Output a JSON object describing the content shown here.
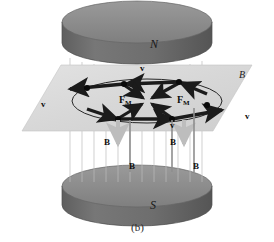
{
  "figure": {
    "caption": "(b)",
    "background_color": "#ffffff"
  },
  "poles": {
    "north": {
      "label": "N",
      "name": "north-pole-cylinder"
    },
    "south": {
      "label": "S",
      "name": "south-pole-cylinder"
    }
  },
  "plane": {
    "field_label": "B",
    "color": "#d9d9d9"
  },
  "velocity_labels": [
    {
      "text": "v",
      "x": 140,
      "y": 64
    },
    {
      "text": "v",
      "x": 41,
      "y": 100
    },
    {
      "text": "v",
      "x": 245,
      "y": 112
    },
    {
      "text": "v",
      "x": 170,
      "y": 121
    }
  ],
  "force_labels": [
    {
      "text": "F",
      "sub": "M",
      "x": 119,
      "y": 95
    },
    {
      "text": "F",
      "sub": "M",
      "x": 177,
      "y": 95
    }
  ],
  "b_field_labels": [
    {
      "text": "B",
      "x": 104,
      "y": 138
    },
    {
      "text": "B",
      "x": 170,
      "y": 138
    },
    {
      "text": "B",
      "x": 129,
      "y": 162
    },
    {
      "text": "B",
      "x": 193,
      "y": 162
    }
  ],
  "colors": {
    "cylinder_top": "#8d8d8d",
    "cylinder_side": "#6f6f6f",
    "plane": "#d9d9d9",
    "field_line": "#b9b9b9",
    "arrow_dark": "#1b1b1b",
    "arrow_gray": "#bdbdbd",
    "vertex_dot": "#0a0a0a",
    "orbit_ellipse": "#262626"
  },
  "geometry": {
    "hexagon_vertices": [
      {
        "x": 124,
        "y": 84
      },
      {
        "x": 179,
        "y": 82
      },
      {
        "x": 207,
        "y": 105
      },
      {
        "x": 172,
        "y": 119
      },
      {
        "x": 118,
        "y": 119
      },
      {
        "x": 87,
        "y": 83
      }
    ],
    "center": {
      "x": 147,
      "y": 101
    }
  }
}
